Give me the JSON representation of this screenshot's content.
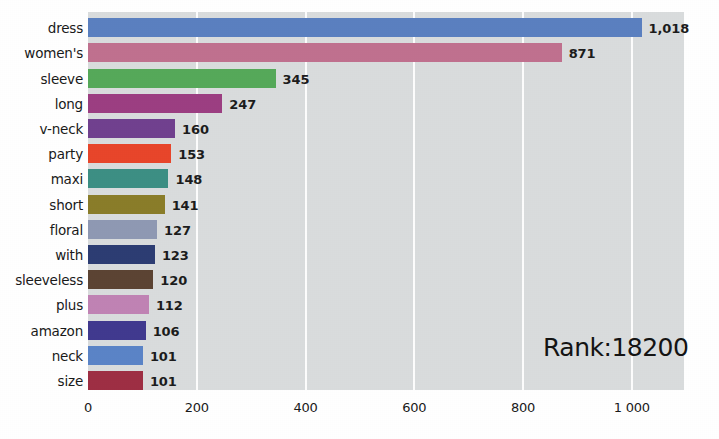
{
  "chart_data": {
    "type": "bar",
    "orientation": "horizontal",
    "title": "",
    "xlabel": "",
    "ylabel": "",
    "xlim": [
      0,
      1096
    ],
    "grid": true,
    "legend": false,
    "xticks": [
      {
        "value": 0,
        "label": "0"
      },
      {
        "value": 200,
        "label": "200"
      },
      {
        "value": 400,
        "label": "400"
      },
      {
        "value": 600,
        "label": "600"
      },
      {
        "value": 800,
        "label": "800"
      },
      {
        "value": 1000,
        "label": "1 000"
      }
    ],
    "categories": [
      "dress",
      "women's",
      "sleeve",
      "long",
      "v-neck",
      "party",
      "maxi",
      "short",
      "floral",
      "with",
      "sleeveless",
      "plus",
      "amazon",
      "neck",
      "size"
    ],
    "values": [
      1018,
      871,
      345,
      247,
      160,
      153,
      148,
      141,
      127,
      123,
      120,
      112,
      106,
      101,
      101
    ],
    "value_labels": [
      "1,018",
      "871",
      "345",
      "247",
      "160",
      "153",
      "148",
      "141",
      "127",
      "123",
      "120",
      "112",
      "106",
      "101",
      "101"
    ],
    "colors": [
      "#5b80c0",
      "#c0718f",
      "#56a95a",
      "#9c3f82",
      "#71418f",
      "#e8462b",
      "#3d8f84",
      "#8a7d2a",
      "#8f99b3",
      "#2d3d73",
      "#5c4434",
      "#c083b4",
      "#413a8f",
      "#5b84c7",
      "#9e2f44"
    ],
    "annotation": "Rank:18200",
    "background_color": "#d9dcdd",
    "gridline_color": "#fdfdfd",
    "figure_background": "#ffffff"
  }
}
